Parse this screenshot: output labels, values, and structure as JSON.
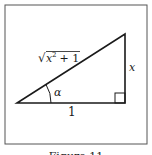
{
  "figure": {
    "caption": "Figure 11",
    "colors": {
      "stroke": "#1a1a1a",
      "background": "#ffffff",
      "frame": "#555555"
    },
    "triangle": {
      "hypotenuse_label_prefix": "√",
      "hypotenuse_label_x": "x",
      "hypotenuse_label_exp": "2",
      "hypotenuse_label_rest": " + 1",
      "opposite_label": "x",
      "adjacent_label": "1",
      "angle_label": "α",
      "right_angle_marker": "square"
    }
  }
}
